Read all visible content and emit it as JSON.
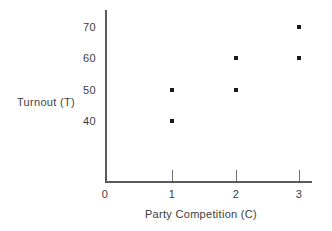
{
  "chart_data": {
    "type": "scatter",
    "title": "",
    "xlabel": "Party Competition (C)",
    "ylabel": "Turnout (T)",
    "xlim": [
      0,
      3.3
    ],
    "ylim": [
      35,
      75
    ],
    "grid": false,
    "legend": null,
    "x_ticks": [
      {
        "value": 0,
        "label": "0",
        "px": 105
      },
      {
        "value": 1,
        "label": "1",
        "px": 172
      },
      {
        "value": 2,
        "label": "2",
        "px": 236
      },
      {
        "value": 3,
        "label": "3",
        "px": 299
      }
    ],
    "y_ticks": [
      {
        "value": 70,
        "label": "70",
        "px": 27
      },
      {
        "value": 60,
        "label": "60",
        "px": 58
      },
      {
        "value": 50,
        "label": "50",
        "px": 90
      },
      {
        "value": 40,
        "label": "40",
        "px": 121
      }
    ],
    "points": [
      {
        "x": 1,
        "y": 50,
        "px": 172,
        "py": 90
      },
      {
        "x": 1,
        "y": 40,
        "px": 172,
        "py": 121
      },
      {
        "x": 2,
        "y": 60,
        "px": 236,
        "py": 58
      },
      {
        "x": 2,
        "y": 50,
        "px": 236,
        "py": 90
      },
      {
        "x": 3,
        "y": 70,
        "px": 299,
        "py": 27
      },
      {
        "x": 3,
        "y": 60,
        "px": 299,
        "py": 58
      }
    ],
    "marker": "square",
    "marker_color": "#1a1a1a",
    "axis_color": "#5a5a5a",
    "background": "#ffffff"
  }
}
